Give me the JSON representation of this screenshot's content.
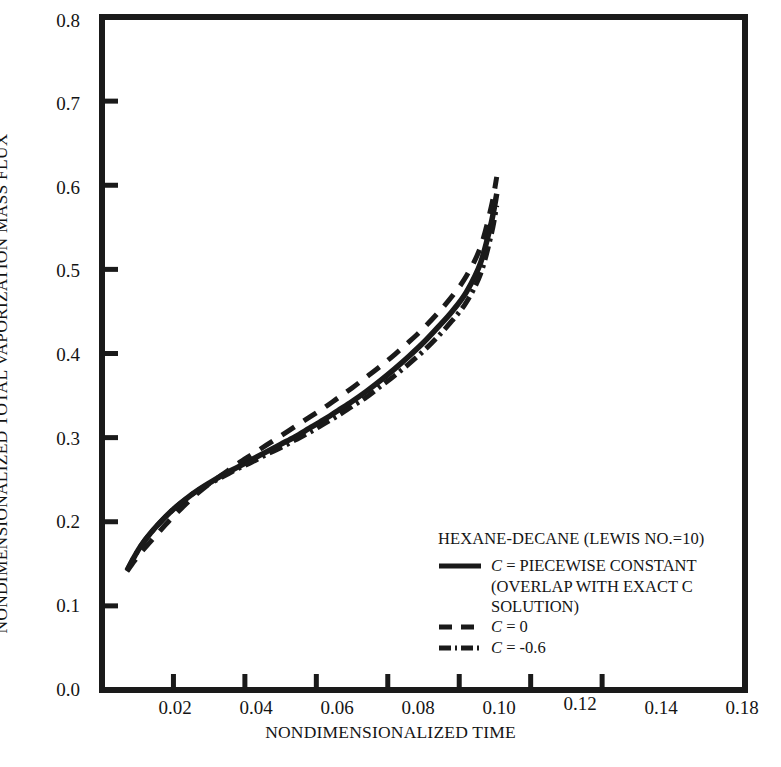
{
  "chart_data": {
    "type": "line",
    "title": "",
    "xlabel": "NONDIMENSIONALIZED TIME",
    "ylabel": "NONDIMENSIONALIZED TOTAL VAPORIZATION MASS FLUX",
    "xlim": [
      0.0,
      0.18
    ],
    "ylim": [
      0.0,
      0.8
    ],
    "grid": false,
    "xticks": [
      0.0,
      0.02,
      0.04,
      0.06,
      0.08,
      0.1,
      0.12,
      0.14,
      0.18
    ],
    "xtick_labels": [
      "",
      "0.02",
      "0.04",
      "0.06",
      "0.08",
      "0.10",
      "0.12",
      "0.14",
      "0.18"
    ],
    "yticks": [
      0.0,
      0.1,
      0.2,
      0.3,
      0.4,
      0.5,
      0.6,
      0.7,
      0.8
    ],
    "ytick_labels": [
      "0.0",
      "0.1",
      "0.2",
      "0.3",
      "0.4",
      "0.5",
      "0.6",
      "0.7",
      "0.8"
    ],
    "legend_position": "lower-right-inside",
    "annotation": "HEXANE-DECANE (LEWIS NO.=10)",
    "series": [
      {
        "name": "C = PIECEWISE CONSTANT (OVERLAP WITH EXACT C SOLUTION)",
        "style": "solid",
        "color": "#1a1a1a",
        "x": [
          0.007,
          0.009,
          0.011,
          0.0135,
          0.016,
          0.019,
          0.022,
          0.026,
          0.03,
          0.034,
          0.038,
          0.042,
          0.046,
          0.05,
          0.054,
          0.058,
          0.062,
          0.066,
          0.07,
          0.074,
          0.078,
          0.082,
          0.086,
          0.09,
          0.094,
          0.098,
          0.102,
          0.106,
          0.109,
          0.1105
        ],
        "y": [
          0.142,
          0.158,
          0.172,
          0.186,
          0.198,
          0.211,
          0.222,
          0.235,
          0.246,
          0.256,
          0.265,
          0.274,
          0.283,
          0.292,
          0.301,
          0.311,
          0.321,
          0.332,
          0.343,
          0.355,
          0.368,
          0.382,
          0.397,
          0.413,
          0.431,
          0.45,
          0.473,
          0.508,
          0.556,
          0.59
        ]
      },
      {
        "name": "C = 0",
        "style": "dashed",
        "color": "#1a1a1a",
        "x": [
          0.007,
          0.009,
          0.011,
          0.0135,
          0.016,
          0.019,
          0.022,
          0.026,
          0.03,
          0.034,
          0.038,
          0.042,
          0.046,
          0.05,
          0.054,
          0.058,
          0.062,
          0.066,
          0.07,
          0.074,
          0.078,
          0.082,
          0.086,
          0.09,
          0.094,
          0.098,
          0.102,
          0.106,
          0.109,
          0.1105
        ],
        "y": [
          0.141,
          0.153,
          0.164,
          0.176,
          0.188,
          0.202,
          0.215,
          0.231,
          0.245,
          0.257,
          0.269,
          0.28,
          0.291,
          0.302,
          0.313,
          0.324,
          0.335,
          0.347,
          0.359,
          0.372,
          0.385,
          0.399,
          0.414,
          0.43,
          0.448,
          0.468,
          0.492,
          0.527,
          0.575,
          0.61
        ]
      },
      {
        "name": "C = -0.6",
        "style": "dashdot",
        "color": "#1a1a1a",
        "x": [
          0.007,
          0.009,
          0.011,
          0.0135,
          0.016,
          0.019,
          0.022,
          0.026,
          0.03,
          0.034,
          0.038,
          0.042,
          0.046,
          0.05,
          0.054,
          0.058,
          0.062,
          0.066,
          0.07,
          0.074,
          0.078,
          0.082,
          0.086,
          0.09,
          0.094,
          0.098,
          0.102,
          0.106,
          0.109,
          0.1105
        ],
        "y": [
          0.142,
          0.158,
          0.172,
          0.186,
          0.198,
          0.211,
          0.222,
          0.235,
          0.245,
          0.254,
          0.263,
          0.271,
          0.28,
          0.288,
          0.297,
          0.306,
          0.316,
          0.326,
          0.337,
          0.348,
          0.361,
          0.374,
          0.388,
          0.403,
          0.42,
          0.439,
          0.461,
          0.495,
          0.542,
          0.576
        ]
      }
    ]
  },
  "legend": {
    "title": "HEXANE-DECANE (LEWIS NO.=10)",
    "entries": [
      {
        "var": "C",
        "eq": "=",
        "value": "PIECEWISE CONSTANT",
        "cont1": "(OVERLAP WITH EXACT C",
        "cont2": "SOLUTION)",
        "style": "solid"
      },
      {
        "var": "C",
        "eq": "=",
        "value": "0",
        "style": "dashed"
      },
      {
        "var": "C",
        "eq": "=",
        "value": "-0.6",
        "style": "dashdot"
      }
    ]
  },
  "colors": {
    "ink": "#1a1a1a",
    "background": "#ffffff"
  }
}
